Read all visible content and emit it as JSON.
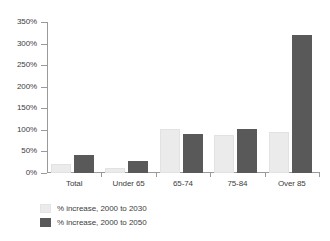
{
  "chart_data": {
    "type": "bar",
    "title": "",
    "xlabel": "",
    "ylabel": "",
    "ylim": [
      0,
      350
    ],
    "ytick_step": 50,
    "grid": false,
    "legend_position": "bottom-left",
    "categories": [
      "Total",
      "Under 65",
      "65-74",
      "75-84",
      "Over 85"
    ],
    "ytick_labels": [
      "0%",
      "50%",
      "100%",
      "150%",
      "200%",
      "250%",
      "300%",
      "350%"
    ],
    "ytick_values": [
      0,
      50,
      100,
      150,
      200,
      250,
      300,
      350
    ],
    "series": [
      {
        "name": "% increase, 2000 to 2030",
        "color": "#ebebeb",
        "values": [
          22,
          12,
          103,
          88,
          95
        ]
      },
      {
        "name": "% increase, 2000 to 2050",
        "color": "#595959",
        "values": [
          41,
          29,
          90,
          103,
          320
        ]
      }
    ]
  },
  "legend": {
    "items": [
      {
        "label": "% increase, 2000 to 2030",
        "swatch": "light-swatch"
      },
      {
        "label": "% increase, 2000 to 2050",
        "swatch": "dark-swatch"
      }
    ]
  },
  "colors": {
    "series_light": "#ebebeb",
    "series_dark": "#595959",
    "axis": "#9a9a9a",
    "text": "#3d3d3d",
    "background": "#ffffff"
  }
}
